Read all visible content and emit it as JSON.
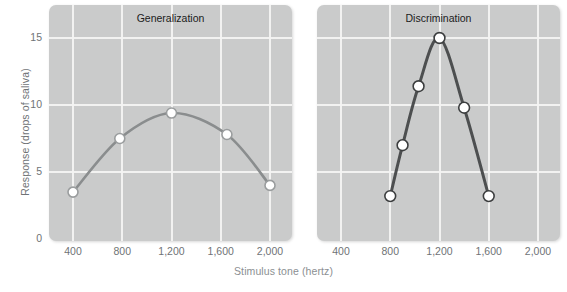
{
  "figure": {
    "xlabel": "Stimulus tone (hertz)",
    "ylabel": "Response (drops of saliva)",
    "background": "#ffffff",
    "panel_background": "#cacbcb",
    "gridline_color": "#f3f3f2",
    "tick_label_color": "#6f7376"
  },
  "chart_data": [
    {
      "type": "line",
      "title": "Generalization",
      "xlabel": "Stimulus tone (hertz)",
      "ylabel": "Response (drops of saliva)",
      "xlim": [
        200,
        2200
      ],
      "ylim": [
        0,
        17.2
      ],
      "xticks": [
        400,
        800,
        1200,
        1600,
        2000
      ],
      "xtick_labels": [
        "400",
        "800",
        "1,200",
        "1,600",
        "2,000"
      ],
      "yticks": [
        0,
        5,
        10,
        15
      ],
      "ytick_labels": [
        "0",
        "5",
        "10",
        "15"
      ],
      "grid": true,
      "legend": "none",
      "line_color": "#8a8d8e",
      "marker_face": "#ffffff",
      "marker_edge": "#9a9d9e",
      "x": [
        400,
        780,
        1200,
        1650,
        2000
      ],
      "y": [
        3.5,
        7.5,
        9.4,
        7.8,
        4.0
      ],
      "points": [
        {
          "x": 400,
          "y": 3.5
        },
        {
          "x": 780,
          "y": 7.5
        },
        {
          "x": 1200,
          "y": 9.4
        },
        {
          "x": 1650,
          "y": 7.8
        },
        {
          "x": 2000,
          "y": 4.0
        }
      ]
    },
    {
      "type": "line",
      "title": "Discrimination",
      "xlabel": "Stimulus tone (hertz)",
      "ylabel": "Response (drops of saliva)",
      "xlim": [
        200,
        2200
      ],
      "ylim": [
        0,
        17.2
      ],
      "xticks": [
        400,
        800,
        1200,
        1600,
        2000
      ],
      "xtick_labels": [
        "400",
        "800",
        "1,200",
        "1,600",
        "2,000"
      ],
      "yticks": [
        0,
        5,
        10,
        15
      ],
      "ytick_labels": [
        "0",
        "5",
        "10",
        "15"
      ],
      "grid": true,
      "legend": "none",
      "line_color": "#4d4f50",
      "marker_face": "#ffffff",
      "marker_edge": "#3c3e3f",
      "x": [
        800,
        900,
        1030,
        1200,
        1400,
        1600
      ],
      "y": [
        3.2,
        7.0,
        11.4,
        15.0,
        9.8,
        3.2
      ],
      "points": [
        {
          "x": 800,
          "y": 3.2
        },
        {
          "x": 900,
          "y": 7.0
        },
        {
          "x": 1030,
          "y": 11.4
        },
        {
          "x": 1200,
          "y": 15.0
        },
        {
          "x": 1400,
          "y": 9.8
        },
        {
          "x": 1600,
          "y": 3.2
        }
      ]
    }
  ]
}
